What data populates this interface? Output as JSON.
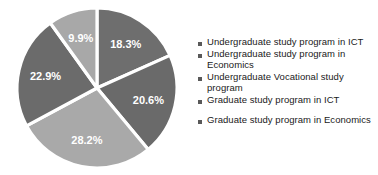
{
  "chart_data": {
    "type": "pie",
    "title": "",
    "subtitle": "",
    "xlabel": "",
    "ylabel": "",
    "grid": false,
    "legend_position": "right",
    "start_angle_deg": 0,
    "direction": "clockwise",
    "categories": [
      "Undergraduate study program in ICT",
      "Undergraduate study program in Economics",
      "Undergraduate Vocational study program",
      "Graduate study program in ICT",
      "Graduate study program in Economics"
    ],
    "values": [
      18.3,
      20.6,
      28.2,
      22.9,
      9.9
    ],
    "value_unit": "%",
    "data_labels": [
      "18.3%",
      "20.6%",
      "28.2%",
      "22.9%",
      "9.9%"
    ],
    "colors": [
      "#6e6e6e",
      "#6a6a6a",
      "#a9a9a9",
      "#6b6b6b",
      "#a8a8a8"
    ],
    "slice_border_color": "#ffffff",
    "data_label_color": "#ffffff"
  },
  "legend": {
    "items": [
      {
        "marker_color": "#595959",
        "label": "Undergraduate study program in ICT"
      },
      {
        "marker_color": "#595959",
        "label": "Undergraduate study program in Economics"
      },
      {
        "marker_color": "#595959",
        "label": "Undergraduate Vocational study program"
      },
      {
        "marker_color": "#595959",
        "label": "Graduate study program in ICT"
      },
      {
        "marker_color": "#595959",
        "label": "Graduate study program in Economics"
      }
    ]
  }
}
